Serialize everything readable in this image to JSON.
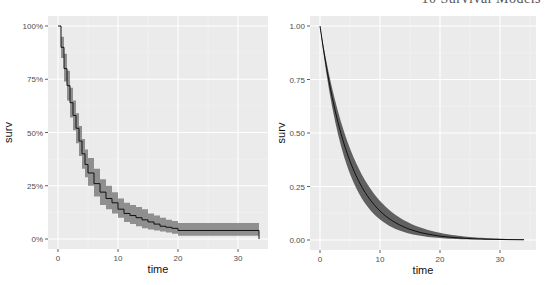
{
  "header": {
    "running_title": "10 Survival Models"
  },
  "chart_data": [
    {
      "type": "line",
      "title": "",
      "description": "Kaplan-Meier survival curve (step) with confidence band",
      "xlabel": "time",
      "ylabel": "surv",
      "xlim": [
        0,
        34
      ],
      "ylim": [
        0,
        1
      ],
      "x_ticks": [
        "0",
        "10",
        "20",
        "30"
      ],
      "y_ticks": [
        "0%",
        "25%",
        "50%",
        "75%",
        "100%"
      ],
      "grid": true,
      "series": [
        {
          "name": "surv",
          "x": [
            0,
            0.5,
            1,
            1.5,
            2,
            2.5,
            3,
            3.5,
            4,
            4.5,
            5,
            6,
            7,
            8,
            9,
            10,
            11,
            12,
            13,
            14,
            15,
            16,
            17,
            18,
            19,
            20,
            25,
            30,
            33,
            33.5
          ],
          "values": [
            1.0,
            0.9,
            0.8,
            0.72,
            0.64,
            0.58,
            0.52,
            0.46,
            0.4,
            0.35,
            0.31,
            0.26,
            0.22,
            0.19,
            0.17,
            0.14,
            0.12,
            0.11,
            0.1,
            0.09,
            0.08,
            0.07,
            0.06,
            0.055,
            0.05,
            0.04,
            0.04,
            0.04,
            0.04,
            0.0
          ],
          "lower": [
            1.0,
            0.85,
            0.74,
            0.65,
            0.57,
            0.51,
            0.45,
            0.39,
            0.33,
            0.29,
            0.25,
            0.2,
            0.16,
            0.14,
            0.12,
            0.1,
            0.08,
            0.07,
            0.06,
            0.05,
            0.045,
            0.04,
            0.035,
            0.03,
            0.025,
            0.015,
            0.015,
            0.015,
            0.015,
            0.015
          ],
          "upper": [
            1.0,
            0.95,
            0.87,
            0.79,
            0.71,
            0.65,
            0.59,
            0.53,
            0.47,
            0.42,
            0.38,
            0.33,
            0.28,
            0.25,
            0.22,
            0.19,
            0.17,
            0.16,
            0.15,
            0.14,
            0.12,
            0.11,
            0.1,
            0.09,
            0.085,
            0.075,
            0.075,
            0.075,
            0.075,
            0.075
          ]
        }
      ]
    },
    {
      "type": "line",
      "title": "",
      "description": "Parametric (exponential) survival curve with confidence band",
      "xlabel": "time",
      "ylabel": "surv",
      "xlim": [
        0,
        34
      ],
      "ylim": [
        0,
        1
      ],
      "x_ticks": [
        "0",
        "10",
        "20",
        "30"
      ],
      "y_ticks": [
        "0.00",
        "0.25",
        "0.50",
        "0.75",
        "1.00"
      ],
      "grid": true,
      "series": [
        {
          "name": "surv",
          "rate": 0.2,
          "rate_lower": 0.17,
          "rate_upper": 0.235,
          "x": [
            0,
            2,
            4,
            6,
            8,
            10,
            12,
            15,
            20,
            25,
            30,
            34
          ],
          "values": [
            1.0,
            0.67,
            0.45,
            0.3,
            0.2,
            0.135,
            0.09,
            0.05,
            0.018,
            0.007,
            0.002,
            0.001
          ]
        }
      ]
    }
  ]
}
